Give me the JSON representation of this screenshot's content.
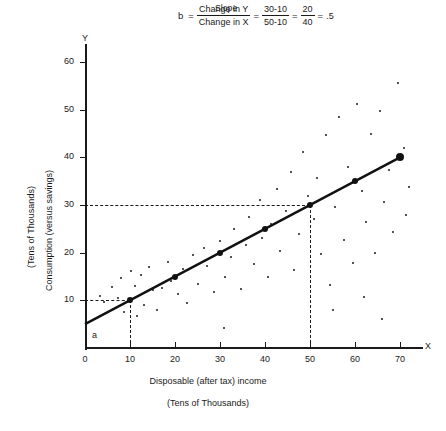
{
  "formula": {
    "caption": "Slope",
    "variable": "b",
    "equals": "=",
    "numerator1": "Change in Y",
    "denominator1": "Change in X",
    "numerator2": "30-10",
    "denominator2": "50-10",
    "numerator3": "20",
    "denominator3": "40",
    "result": ".5"
  },
  "chart_data": {
    "type": "scatter",
    "title": "",
    "xlabel": "Disposable (after tax) income",
    "xlabel_sub": "(Tens of Thousands)",
    "ylabel": "Consumption (versus savings)",
    "ylabel_sub": "(Tens of Thousands)",
    "x_axis_letter": "X",
    "y_axis_letter": "Y",
    "xlim": [
      0,
      75
    ],
    "ylim": [
      0,
      65
    ],
    "xticks": [
      0,
      10,
      20,
      30,
      40,
      50,
      60,
      70
    ],
    "yticks": [
      10,
      20,
      30,
      40,
      50,
      60
    ],
    "xtick_labels": [
      "0",
      "10",
      "20",
      "30",
      "40",
      "50",
      "60",
      "70"
    ],
    "ytick_labels": [
      "10",
      "20",
      "30",
      "40",
      "50",
      "60"
    ],
    "grid": false,
    "legend": "none",
    "intercept_label": "a",
    "regression_line": {
      "intercept": 5,
      "slope": 0.5,
      "equation": "y = 5 + 0.5x",
      "x_start": 0,
      "x_end": 70,
      "marker_points": [
        {
          "x": 10,
          "y": 10
        },
        {
          "x": 20,
          "y": 15
        },
        {
          "x": 30,
          "y": 20
        },
        {
          "x": 40,
          "y": 25
        },
        {
          "x": 50,
          "y": 30
        },
        {
          "x": 60,
          "y": 35
        },
        {
          "x": 70,
          "y": 40
        }
      ]
    },
    "guide_lines": [
      {
        "orientation": "horizontal",
        "value": 10,
        "from_x": 0,
        "to_x": 10,
        "style": "dashed"
      },
      {
        "orientation": "vertical",
        "value": 10,
        "from_y": 0,
        "to_y": 10,
        "style": "dashed"
      },
      {
        "orientation": "horizontal",
        "value": 30,
        "from_x": 0,
        "to_x": 50,
        "style": "dashed"
      },
      {
        "orientation": "vertical",
        "value": 50,
        "from_y": 0,
        "to_y": 30,
        "style": "dashed"
      }
    ],
    "scatter_points": [
      {
        "x": 3.4,
        "y": 11.0
      },
      {
        "x": 4.2,
        "y": 9.6
      },
      {
        "x": 6.1,
        "y": 12.8
      },
      {
        "x": 7.3,
        "y": 10.4
      },
      {
        "x": 8.0,
        "y": 14.6
      },
      {
        "x": 8.6,
        "y": 7.6
      },
      {
        "x": 10.2,
        "y": 16.2
      },
      {
        "x": 11.0,
        "y": 13.1
      },
      {
        "x": 11.6,
        "y": 6.8
      },
      {
        "x": 12.4,
        "y": 15.4
      },
      {
        "x": 13.0,
        "y": 9.0
      },
      {
        "x": 14.2,
        "y": 17.0
      },
      {
        "x": 15.1,
        "y": 12.1
      },
      {
        "x": 16.0,
        "y": 8.0
      },
      {
        "x": 17.2,
        "y": 12.6
      },
      {
        "x": 18.4,
        "y": 18.0
      },
      {
        "x": 19.0,
        "y": 14.0
      },
      {
        "x": 20.6,
        "y": 11.4
      },
      {
        "x": 21.8,
        "y": 16.6
      },
      {
        "x": 22.6,
        "y": 9.4
      },
      {
        "x": 24.0,
        "y": 19.6
      },
      {
        "x": 25.2,
        "y": 13.4
      },
      {
        "x": 26.4,
        "y": 21.0
      },
      {
        "x": 27.0,
        "y": 17.2
      },
      {
        "x": 28.6,
        "y": 11.8
      },
      {
        "x": 30.0,
        "y": 22.4
      },
      {
        "x": 31.2,
        "y": 15.0
      },
      {
        "x": 32.4,
        "y": 19.0
      },
      {
        "x": 33.0,
        "y": 25.0
      },
      {
        "x": 34.6,
        "y": 12.4
      },
      {
        "x": 35.8,
        "y": 21.6
      },
      {
        "x": 36.4,
        "y": 27.4
      },
      {
        "x": 37.6,
        "y": 17.6
      },
      {
        "x": 38.8,
        "y": 31.0
      },
      {
        "x": 39.4,
        "y": 23.0
      },
      {
        "x": 40.6,
        "y": 14.8
      },
      {
        "x": 41.4,
        "y": 26.0
      },
      {
        "x": 42.6,
        "y": 33.4
      },
      {
        "x": 43.4,
        "y": 20.4
      },
      {
        "x": 44.6,
        "y": 28.8
      },
      {
        "x": 45.8,
        "y": 37.0
      },
      {
        "x": 46.4,
        "y": 16.4
      },
      {
        "x": 47.6,
        "y": 24.0
      },
      {
        "x": 48.4,
        "y": 41.2
      },
      {
        "x": 49.6,
        "y": 31.8
      },
      {
        "x": 50.8,
        "y": 27.0
      },
      {
        "x": 51.6,
        "y": 35.6
      },
      {
        "x": 52.4,
        "y": 19.8
      },
      {
        "x": 53.6,
        "y": 44.6
      },
      {
        "x": 54.4,
        "y": 13.2
      },
      {
        "x": 55.6,
        "y": 29.6
      },
      {
        "x": 56.4,
        "y": 48.4
      },
      {
        "x": 57.6,
        "y": 22.6
      },
      {
        "x": 58.4,
        "y": 38.0
      },
      {
        "x": 59.6,
        "y": 17.8
      },
      {
        "x": 60.4,
        "y": 51.2
      },
      {
        "x": 61.6,
        "y": 33.0
      },
      {
        "x": 62.4,
        "y": 26.4
      },
      {
        "x": 63.6,
        "y": 45.0
      },
      {
        "x": 64.4,
        "y": 20.0
      },
      {
        "x": 65.6,
        "y": 49.8
      },
      {
        "x": 66.4,
        "y": 30.6
      },
      {
        "x": 67.6,
        "y": 37.4
      },
      {
        "x": 68.4,
        "y": 24.4
      },
      {
        "x": 69.6,
        "y": 55.6
      },
      {
        "x": 70.8,
        "y": 42.0
      },
      {
        "x": 71.4,
        "y": 28.0
      },
      {
        "x": 72.0,
        "y": 33.8
      },
      {
        "x": 30.8,
        "y": 4.2
      },
      {
        "x": 55.0,
        "y": 8.0
      },
      {
        "x": 62.0,
        "y": 10.8
      },
      {
        "x": 66.0,
        "y": 6.0
      }
    ]
  }
}
